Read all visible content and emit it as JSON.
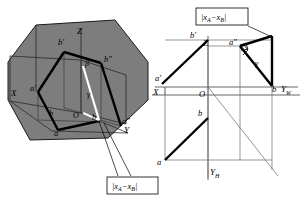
{
  "figure": {
    "background_color": "#ffffff",
    "plane_fill": "#7d7d7d",
    "plane_stroke": "#1a1a1a",
    "thin_line_color": "#4a4a4a",
    "bold_line_color": "#000000",
    "white_line_color": "#ffffff"
  },
  "left_view": {
    "name": "axonometric-pictorial-view",
    "axes": [
      {
        "id": "x",
        "label": "X"
      },
      {
        "id": "y",
        "label": "Y"
      },
      {
        "id": "z",
        "label": "Z"
      }
    ],
    "origin_label": "O",
    "points": [
      {
        "id": "a-front",
        "label": "a'"
      },
      {
        "id": "b-front",
        "label": "b'"
      },
      {
        "id": "b-side",
        "label": "b″"
      },
      {
        "id": "a-side",
        "label": "a″"
      },
      {
        "id": "a-top",
        "label": "a"
      },
      {
        "id": "b-top",
        "label": "b"
      },
      {
        "id": "b-plain",
        "label": "b"
      }
    ],
    "angles": [
      {
        "id": "beta",
        "label": "β"
      },
      {
        "id": "gamma",
        "label": "γ"
      }
    ],
    "callout": {
      "id": "distance-callout-left",
      "text": "|xₐ−xʙ|",
      "text_main": "|x",
      "sub_a": "A",
      "minus": "−x",
      "sub_b": "B",
      "close": "|"
    }
  },
  "right_view": {
    "name": "orthographic-three-view-drawing",
    "axes": [
      {
        "id": "x",
        "label": "X"
      },
      {
        "id": "z",
        "label": "Z"
      },
      {
        "id": "yw",
        "label": "Y",
        "sub": "W"
      },
      {
        "id": "yh",
        "label": "Y",
        "sub": "H"
      }
    ],
    "origin_label": "O",
    "points": [
      {
        "id": "a-front",
        "label": "a'"
      },
      {
        "id": "b-front",
        "label": "b'"
      },
      {
        "id": "a-side",
        "label": "a″"
      },
      {
        "id": "b-side",
        "label": "b"
      },
      {
        "id": "b-top",
        "label": "b"
      },
      {
        "id": "a-top",
        "label": "a"
      }
    ],
    "angles": [
      {
        "id": "gamma",
        "label": "γ"
      }
    ],
    "right_angle_marker": {
      "id": "right-angle-at-a-side",
      "label": ""
    },
    "callout": {
      "id": "distance-callout-right",
      "text": "|xₐ−xʙ|",
      "text_main": "|x",
      "sub_a": "A",
      "minus": "−x",
      "sub_b": "B",
      "close": "|"
    }
  }
}
